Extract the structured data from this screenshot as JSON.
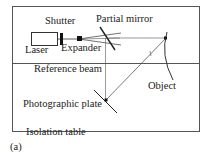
{
  "figure": {
    "caption": "(a)"
  },
  "labels": {
    "shutter": "Shutter",
    "partial_mirror": "Partial mirror",
    "laser": "Laser",
    "expander": "Expander",
    "reference_beam": "Reference beam",
    "object": "Object",
    "photographic_plate": "Photographic plate",
    "isolation_table": "Isolation table"
  },
  "components": [
    {
      "name": "Laser",
      "shape": "rectangle"
    },
    {
      "name": "Shutter",
      "shape": "thick vertical bar"
    },
    {
      "name": "Expander",
      "shape": "small filled square"
    },
    {
      "name": "Partial mirror",
      "shape": "diagonal line"
    },
    {
      "name": "Object",
      "shape": "curved arc"
    },
    {
      "name": "Photographic plate",
      "shape": "diagonal line"
    },
    {
      "name": "Isolation table",
      "shape": "enclosing rectangle"
    }
  ],
  "colors": {
    "line": "#333333",
    "frame": "#555555",
    "background": "#ffffff"
  }
}
